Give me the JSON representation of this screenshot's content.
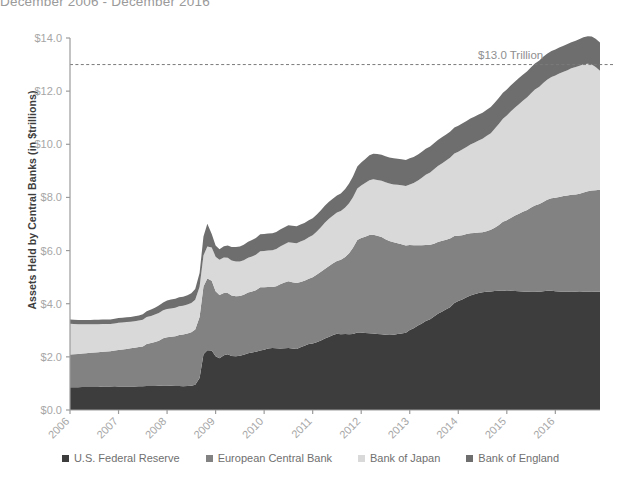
{
  "title": "December 2006 - December 2016",
  "axes": {
    "ylabel": "Assets Held by Central Banks (in $trillions)",
    "yticks": [
      "$0.0",
      "$2.0",
      "$4.0",
      "$6.0",
      "$8.0",
      "$10.0",
      "$12.0",
      "$14.0"
    ],
    "xticks": [
      "2006",
      "2007",
      "2008",
      "2009",
      "2010",
      "2011",
      "2012",
      "2013",
      "2014",
      "2015",
      "2016"
    ]
  },
  "annotation": {
    "label": "$13.0 Trillion",
    "value": 13.0
  },
  "legend": [
    {
      "label": "U.S. Federal Reserve",
      "color": "#3d3d3d"
    },
    {
      "label": "European Central Bank",
      "color": "#828282"
    },
    {
      "label": "Bank of Japan",
      "color": "#d9d9d9"
    },
    {
      "label": "Bank of England",
      "color": "#6e6e6e"
    }
  ],
  "colors": {
    "fed": "#3d3d3d",
    "ecb": "#828282",
    "boj": "#d9d9d9",
    "boe": "#6e6e6e",
    "axis": "#9b9b9b",
    "tick_text": "#a6a6a6",
    "annotation_line": "#7a7a7a"
  },
  "chart_data": {
    "type": "area",
    "stacked": true,
    "title": "December 2006 - December 2016",
    "xlabel": "",
    "ylabel": "Assets Held by Central Banks (in $trillions)",
    "xlim": [
      2006.0,
      2016.92
    ],
    "ylim": [
      0,
      14
    ],
    "ytick_step": 2,
    "grid": false,
    "legend_position": "bottom",
    "annotations": [
      {
        "type": "hline",
        "y": 13.0,
        "label": "$13.0 Trillion",
        "style": "dashed"
      }
    ],
    "x": [
      2006.0,
      2006.08,
      2006.17,
      2006.25,
      2006.33,
      2006.42,
      2006.5,
      2006.58,
      2006.67,
      2006.75,
      2006.83,
      2006.92,
      2007.0,
      2007.08,
      2007.17,
      2007.25,
      2007.33,
      2007.42,
      2007.5,
      2007.58,
      2007.67,
      2007.75,
      2007.83,
      2007.92,
      2008.0,
      2008.08,
      2008.17,
      2008.25,
      2008.33,
      2008.42,
      2008.5,
      2008.58,
      2008.67,
      2008.75,
      2008.83,
      2008.92,
      2009.0,
      2009.08,
      2009.17,
      2009.25,
      2009.33,
      2009.42,
      2009.5,
      2009.58,
      2009.67,
      2009.75,
      2009.83,
      2009.92,
      2010.0,
      2010.08,
      2010.17,
      2010.25,
      2010.33,
      2010.42,
      2010.5,
      2010.58,
      2010.67,
      2010.75,
      2010.83,
      2010.92,
      2011.0,
      2011.08,
      2011.17,
      2011.25,
      2011.33,
      2011.42,
      2011.5,
      2011.58,
      2011.67,
      2011.75,
      2011.83,
      2011.92,
      2012.0,
      2012.08,
      2012.17,
      2012.25,
      2012.33,
      2012.42,
      2012.5,
      2012.58,
      2012.67,
      2012.75,
      2012.83,
      2012.92,
      2013.0,
      2013.08,
      2013.17,
      2013.25,
      2013.33,
      2013.42,
      2013.5,
      2013.58,
      2013.67,
      2013.75,
      2013.83,
      2013.92,
      2014.0,
      2014.08,
      2014.17,
      2014.25,
      2014.33,
      2014.42,
      2014.5,
      2014.58,
      2014.67,
      2014.75,
      2014.83,
      2014.92,
      2015.0,
      2015.08,
      2015.17,
      2015.25,
      2015.33,
      2015.42,
      2015.5,
      2015.58,
      2015.67,
      2015.75,
      2015.83,
      2015.92,
      2016.0,
      2016.08,
      2016.17,
      2016.25,
      2016.33,
      2016.42,
      2016.5,
      2016.58,
      2016.67,
      2016.75,
      2016.83,
      2016.92
    ],
    "series": [
      {
        "name": "U.S. Federal Reserve",
        "color": "#3d3d3d",
        "values": [
          0.86,
          0.86,
          0.86,
          0.87,
          0.87,
          0.87,
          0.87,
          0.87,
          0.88,
          0.88,
          0.88,
          0.89,
          0.88,
          0.88,
          0.88,
          0.88,
          0.88,
          0.89,
          0.89,
          0.9,
          0.9,
          0.9,
          0.91,
          0.92,
          0.92,
          0.91,
          0.9,
          0.9,
          0.89,
          0.9,
          0.91,
          0.95,
          1.2,
          2.1,
          2.25,
          2.24,
          2.02,
          1.95,
          2.06,
          2.1,
          2.03,
          2.02,
          2.04,
          2.08,
          2.14,
          2.16,
          2.19,
          2.24,
          2.27,
          2.31,
          2.33,
          2.32,
          2.31,
          2.32,
          2.33,
          2.31,
          2.3,
          2.36,
          2.42,
          2.48,
          2.5,
          2.55,
          2.62,
          2.69,
          2.75,
          2.82,
          2.87,
          2.85,
          2.86,
          2.85,
          2.86,
          2.92,
          2.92,
          2.9,
          2.89,
          2.88,
          2.86,
          2.85,
          2.83,
          2.82,
          2.83,
          2.86,
          2.88,
          2.91,
          3.01,
          3.08,
          3.18,
          3.26,
          3.35,
          3.42,
          3.52,
          3.62,
          3.71,
          3.79,
          3.87,
          4.03,
          4.1,
          4.16,
          4.24,
          4.31,
          4.36,
          4.4,
          4.43,
          4.45,
          4.46,
          4.48,
          4.49,
          4.5,
          4.48,
          4.49,
          4.48,
          4.47,
          4.46,
          4.45,
          4.46,
          4.46,
          4.45,
          4.47,
          4.49,
          4.49,
          4.47,
          4.46,
          4.45,
          4.45,
          4.46,
          4.45,
          4.44,
          4.45,
          4.45,
          4.46,
          4.45,
          4.45
        ]
      },
      {
        "name": "European Central Bank",
        "color": "#828282",
        "values": [
          1.23,
          1.24,
          1.25,
          1.26,
          1.27,
          1.28,
          1.29,
          1.3,
          1.31,
          1.32,
          1.33,
          1.35,
          1.38,
          1.4,
          1.42,
          1.44,
          1.46,
          1.48,
          1.5,
          1.58,
          1.62,
          1.66,
          1.7,
          1.78,
          1.82,
          1.85,
          1.88,
          1.92,
          1.95,
          1.98,
          2.02,
          2.08,
          2.3,
          2.55,
          2.7,
          2.62,
          2.45,
          2.38,
          2.34,
          2.3,
          2.28,
          2.26,
          2.25,
          2.26,
          2.28,
          2.3,
          2.32,
          2.38,
          2.35,
          2.32,
          2.3,
          2.34,
          2.42,
          2.48,
          2.52,
          2.5,
          2.48,
          2.46,
          2.44,
          2.46,
          2.5,
          2.54,
          2.58,
          2.62,
          2.66,
          2.7,
          2.74,
          2.8,
          2.9,
          3.05,
          3.25,
          3.48,
          3.55,
          3.62,
          3.7,
          3.72,
          3.7,
          3.66,
          3.6,
          3.54,
          3.48,
          3.42,
          3.36,
          3.28,
          3.2,
          3.12,
          3.02,
          2.94,
          2.86,
          2.8,
          2.74,
          2.7,
          2.66,
          2.62,
          2.58,
          2.52,
          2.46,
          2.42,
          2.38,
          2.34,
          2.3,
          2.28,
          2.26,
          2.28,
          2.32,
          2.38,
          2.46,
          2.58,
          2.66,
          2.74,
          2.84,
          2.92,
          3.0,
          3.08,
          3.16,
          3.24,
          3.3,
          3.36,
          3.42,
          3.48,
          3.52,
          3.56,
          3.6,
          3.62,
          3.64,
          3.66,
          3.7,
          3.74,
          3.78,
          3.8,
          3.82,
          3.84
        ]
      },
      {
        "name": "Bank of Japan",
        "color": "#d9d9d9",
        "values": [
          1.16,
          1.14,
          1.12,
          1.1,
          1.09,
          1.08,
          1.07,
          1.06,
          1.05,
          1.04,
          1.03,
          1.02,
          1.02,
          1.01,
          1.01,
          1.0,
          1.0,
          1.0,
          1.01,
          1.02,
          1.02,
          1.03,
          1.04,
          1.05,
          1.06,
          1.06,
          1.07,
          1.08,
          1.08,
          1.09,
          1.1,
          1.12,
          1.14,
          1.16,
          1.2,
          1.26,
          1.3,
          1.32,
          1.34,
          1.33,
          1.32,
          1.31,
          1.3,
          1.3,
          1.31,
          1.32,
          1.33,
          1.35,
          1.36,
          1.37,
          1.38,
          1.4,
          1.42,
          1.44,
          1.46,
          1.48,
          1.5,
          1.52,
          1.54,
          1.56,
          1.58,
          1.62,
          1.68,
          1.74,
          1.78,
          1.8,
          1.82,
          1.84,
          1.86,
          1.88,
          1.9,
          1.94,
          1.98,
          2.02,
          2.06,
          2.08,
          2.1,
          2.12,
          2.14,
          2.16,
          2.18,
          2.2,
          2.22,
          2.24,
          2.28,
          2.34,
          2.44,
          2.54,
          2.64,
          2.72,
          2.8,
          2.86,
          2.92,
          2.98,
          3.04,
          3.1,
          3.16,
          3.22,
          3.28,
          3.34,
          3.4,
          3.46,
          3.52,
          3.58,
          3.64,
          3.72,
          3.8,
          3.88,
          3.94,
          4.0,
          4.06,
          4.12,
          4.18,
          4.24,
          4.3,
          4.36,
          4.42,
          4.48,
          4.52,
          4.56,
          4.6,
          4.64,
          4.68,
          4.72,
          4.76,
          4.8,
          4.82,
          4.82,
          4.8,
          4.74,
          4.64,
          4.48
        ]
      },
      {
        "name": "Bank of England",
        "color": "#6e6e6e",
        "values": [
          0.16,
          0.16,
          0.16,
          0.16,
          0.16,
          0.16,
          0.17,
          0.17,
          0.17,
          0.17,
          0.17,
          0.17,
          0.18,
          0.18,
          0.18,
          0.18,
          0.19,
          0.19,
          0.2,
          0.22,
          0.24,
          0.26,
          0.28,
          0.3,
          0.32,
          0.34,
          0.34,
          0.34,
          0.34,
          0.35,
          0.36,
          0.4,
          0.52,
          0.72,
          0.86,
          0.5,
          0.42,
          0.4,
          0.42,
          0.46,
          0.5,
          0.54,
          0.56,
          0.58,
          0.6,
          0.62,
          0.63,
          0.64,
          0.64,
          0.64,
          0.64,
          0.64,
          0.64,
          0.64,
          0.64,
          0.64,
          0.64,
          0.64,
          0.64,
          0.64,
          0.64,
          0.64,
          0.64,
          0.64,
          0.64,
          0.64,
          0.64,
          0.66,
          0.7,
          0.74,
          0.78,
          0.82,
          0.86,
          0.9,
          0.94,
          0.96,
          0.97,
          0.98,
          0.98,
          0.98,
          0.98,
          0.98,
          0.98,
          0.98,
          0.98,
          0.98,
          0.98,
          0.98,
          0.98,
          0.98,
          0.98,
          0.98,
          0.98,
          0.98,
          0.98,
          0.98,
          0.98,
          0.98,
          0.98,
          0.98,
          0.98,
          0.98,
          0.98,
          0.98,
          0.98,
          0.98,
          0.98,
          0.98,
          0.98,
          0.98,
          0.98,
          0.98,
          0.98,
          0.98,
          0.98,
          0.98,
          0.98,
          0.98,
          0.98,
          0.98,
          0.98,
          0.98,
          0.98,
          0.98,
          0.98,
          0.99,
          1.0,
          1.02,
          1.04,
          1.06,
          1.06,
          1.06
        ]
      }
    ]
  }
}
